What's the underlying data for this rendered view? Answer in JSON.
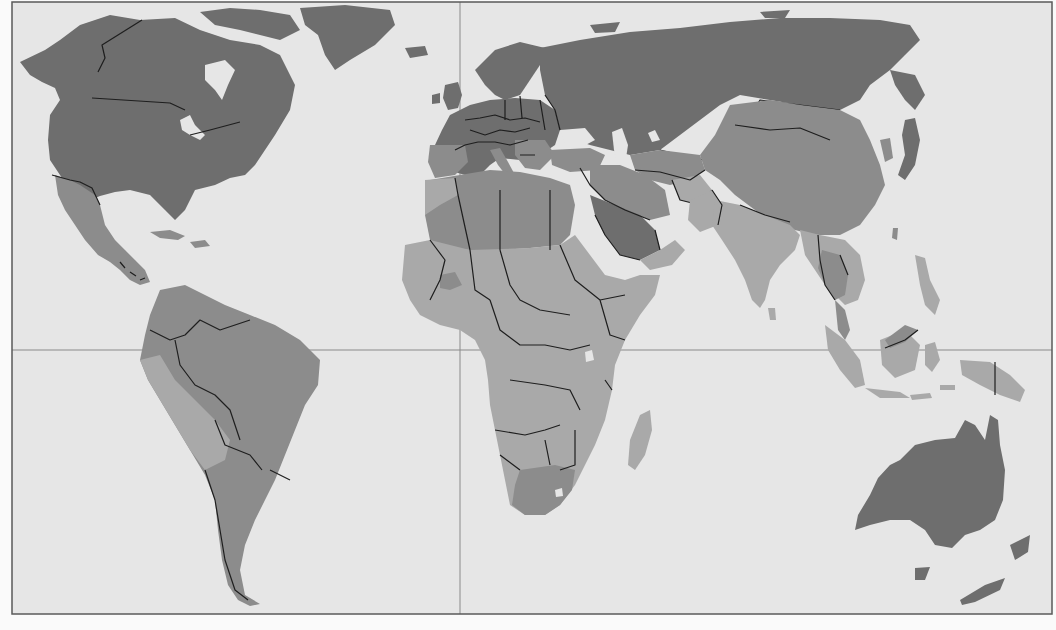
{
  "map": {
    "type": "world choropleth",
    "projection": "cylindrical",
    "colors": {
      "ocean": "#e6e6e6",
      "class_1_darkest": "#6e6e6e",
      "class_2": "#8c8c8c",
      "class_3": "#a9a9a9",
      "class_4_lightest": "#c4c4c4",
      "borders": "#1e1e1e",
      "graticule": "#8a8a8a",
      "frame": "#5a5a5a"
    },
    "graticule": {
      "equator_y": 350,
      "prime_meridian_x": 460
    },
    "regions": [
      {
        "name": "North America (USA, Canada)",
        "class": 1
      },
      {
        "name": "Greenland",
        "class": 1
      },
      {
        "name": "Mexico & Central America",
        "class": 2
      },
      {
        "name": "South America",
        "class": 2
      },
      {
        "name": "Europe",
        "class": 1
      },
      {
        "name": "Russia",
        "class": 1
      },
      {
        "name": "Central & East Asia (China, Mongolia)",
        "class": 2
      },
      {
        "name": "Japan",
        "class": 1
      },
      {
        "name": "Middle East",
        "class": 2
      },
      {
        "name": "Saudi Arabia",
        "class": 1
      },
      {
        "name": "North Africa",
        "class": 2
      },
      {
        "name": "Sub-Saharan Africa",
        "class": 3
      },
      {
        "name": "South Africa",
        "class": 2
      },
      {
        "name": "Madagascar",
        "class": 3
      },
      {
        "name": "South Asia (India)",
        "class": 3
      },
      {
        "name": "Southeast Asia",
        "class": 3
      },
      {
        "name": "Thailand / Cambodia",
        "class": 2
      },
      {
        "name": "Indonesia / Philippines",
        "class": 3
      },
      {
        "name": "Australia",
        "class": 1
      },
      {
        "name": "New Zealand",
        "class": 1
      }
    ]
  }
}
